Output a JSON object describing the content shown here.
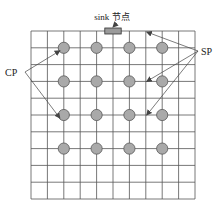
{
  "diagram": {
    "sink_label": "sink 节点",
    "cp_label": "CP",
    "sp_label": "SP",
    "caption": "",
    "grid": {
      "columns": 10,
      "rows": 10
    },
    "sensor_nodes": {
      "columns": [
        2,
        4,
        6,
        8
      ],
      "rows": [
        1,
        3,
        5,
        7
      ]
    },
    "sink_column_span": [
      4.5,
      5.5
    ],
    "cp_targets": [
      {
        "col": 2,
        "row": 1
      },
      {
        "col": 2,
        "row": 5
      }
    ],
    "sp_targets": [
      {
        "col": 7,
        "row": 0
      },
      {
        "col": 7,
        "row": 3
      },
      {
        "col": 7,
        "row": 5
      }
    ],
    "colors": {
      "grid_line": "#555555",
      "node_fill": "#a9a9a9",
      "node_stroke": "#555555",
      "sink_fill": "#9a9a9a",
      "arrow": "#444444"
    }
  }
}
